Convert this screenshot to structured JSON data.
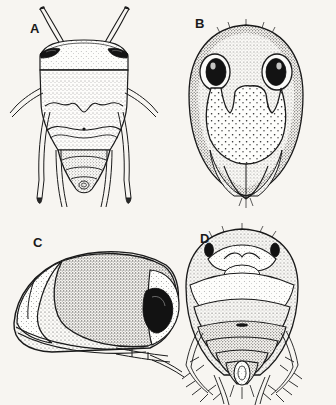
{
  "plate": {
    "title": "Insect morphology plate",
    "background_color": "#f7f5f1",
    "ink_color": "#1a1a1a",
    "width": 336,
    "height": 405,
    "caption": "",
    "scale_bar": ""
  },
  "panels": [
    {
      "id": "A",
      "label": "A",
      "label_x": 30,
      "label_y": 22,
      "view": "dorsal habitus",
      "subject": "water bug",
      "features": [
        "antennae",
        "compound eyes",
        "pronotum",
        "hemelytra",
        "legs",
        "abdomen"
      ]
    },
    {
      "id": "B",
      "label": "B",
      "label_x": 195,
      "label_y": 17,
      "view": "ventral head and thorax",
      "subject": "water bug",
      "features": [
        "compound eyes",
        "rostrum",
        "labium",
        "stippled cuticle"
      ]
    },
    {
      "id": "C",
      "label": "C",
      "label_x": 33,
      "label_y": 236,
      "view": "lateral habitus",
      "subject": "water bug",
      "features": [
        "compound eye",
        "hemelytron",
        "legs",
        "stippled cuticle"
      ]
    },
    {
      "id": "D",
      "label": "D",
      "label_x": 200,
      "label_y": 232,
      "view": "ventral abdomen",
      "subject": "water bug",
      "features": [
        "ocelli",
        "abdominal segments",
        "genital capsule",
        "setal fringe"
      ]
    }
  ]
}
